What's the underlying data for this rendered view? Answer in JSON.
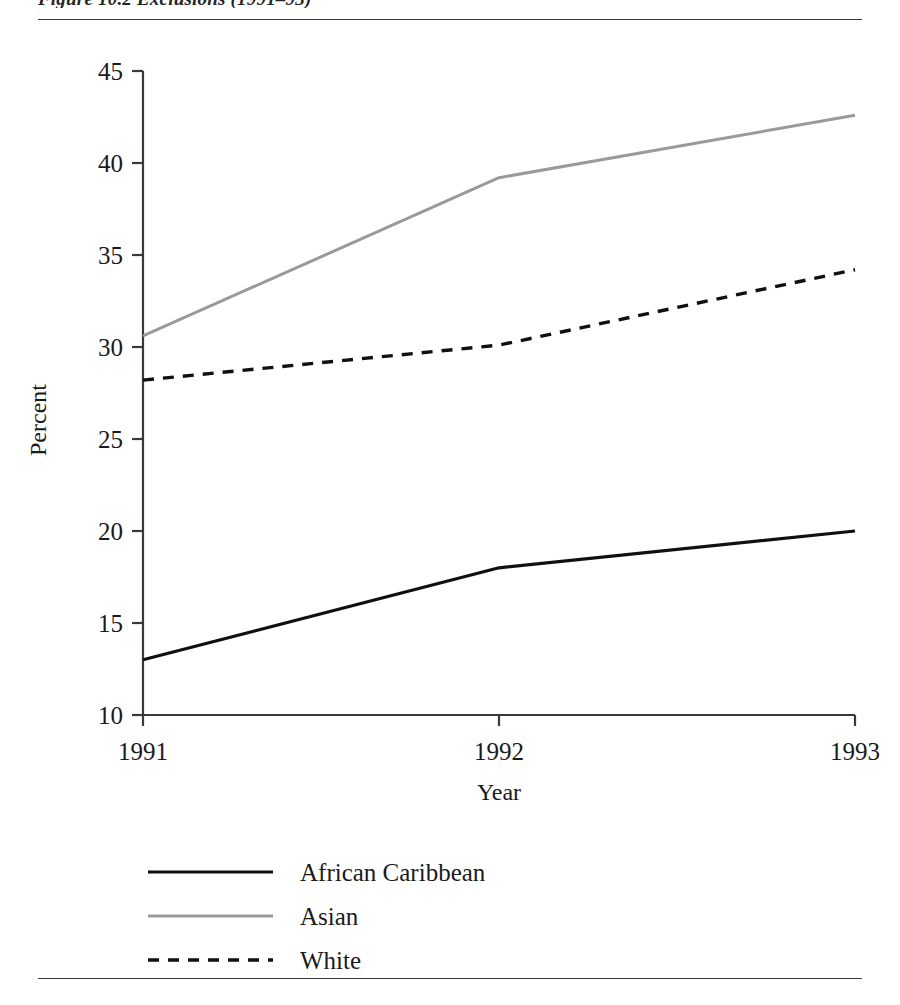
{
  "figure": {
    "caption_partial": "Figure 10.2  Exclusions (1991–93)",
    "top_rule": "horizontal-rule",
    "bottom_rule": "horizontal-rule"
  },
  "chart_data": {
    "type": "line",
    "title": "",
    "xlabel": "Year",
    "ylabel": "Percent",
    "x": [
      "1991",
      "1992",
      "1993"
    ],
    "categories": [
      "1991",
      "1992",
      "1993"
    ],
    "ylim": [
      10,
      45
    ],
    "yticks": [
      10,
      15,
      20,
      25,
      30,
      35,
      40,
      45
    ],
    "ytick_labels": [
      "10",
      "15",
      "20",
      "25",
      "30",
      "35",
      "40",
      "45"
    ],
    "xtick_labels": [
      "1991",
      "1992",
      "1993"
    ],
    "grid": false,
    "legend_position": "below",
    "series": [
      {
        "name": "African Caribbean",
        "values": [
          13.0,
          18.0,
          20.0
        ],
        "color": "#101010",
        "style": "solid",
        "width": 3.2
      },
      {
        "name": "Asian",
        "values": [
          30.6,
          39.2,
          42.6
        ],
        "color": "#9a9a9a",
        "style": "solid",
        "width": 3.0
      },
      {
        "name": "White",
        "values": [
          28.2,
          30.1,
          34.2
        ],
        "color": "#101010",
        "style": "dashed",
        "width": 3.4
      }
    ]
  },
  "legend": {
    "items": [
      {
        "label": "African Caribbean",
        "swatch": "solid-black-line-swatch"
      },
      {
        "label": "Asian",
        "swatch": "solid-gray-line-swatch"
      },
      {
        "label": "White",
        "swatch": "dashed-black-line-swatch"
      }
    ]
  },
  "axes": {
    "y_title": "Percent",
    "x_title": "Year"
  }
}
